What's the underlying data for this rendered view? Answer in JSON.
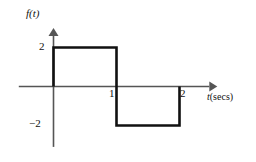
{
  "figure": {
    "background_color": "#ffffff",
    "axis_color": "#555555",
    "waveform_color": "#111111",
    "y_axis_label": "f(t)",
    "x_axis_label_var": "t",
    "x_axis_label_unit": "(secs)",
    "y_tick_pos2": "2",
    "y_tick_neg2": "−2",
    "x_tick_1": "1",
    "x_tick_2": "2"
  },
  "chart_data": {
    "type": "line",
    "title": "",
    "subtitle": "",
    "xlabel": "t(secs)",
    "ylabel": "f(t)",
    "xlim": [
      -0.55,
      2.6
    ],
    "ylim": [
      -3.1,
      3.0
    ],
    "grid": false,
    "legend": "none",
    "x_ticks": [
      1,
      2
    ],
    "x_tick_labels": [
      "1",
      "2"
    ],
    "y_ticks": [
      2,
      -2
    ],
    "y_tick_labels": [
      "2",
      "−2"
    ],
    "series": [
      {
        "name": "f(t)",
        "x": [
          0,
          0,
          1,
          1,
          2,
          2
        ],
        "values": [
          0,
          2,
          2,
          -2,
          -2,
          0
        ],
        "color": "#111111",
        "line_width": 2.6,
        "style": "step"
      }
    ],
    "segments": [
      {
        "name": "rise-at-0",
        "x1": 0,
        "y1": 0,
        "x2": 0,
        "y2": 2
      },
      {
        "name": "high-level",
        "x1": 0,
        "y1": 2,
        "x2": 1,
        "y2": 2
      },
      {
        "name": "fall-at-1",
        "x1": 1,
        "y1": 2,
        "x2": 1,
        "y2": -2
      },
      {
        "name": "low-level",
        "x1": 1,
        "y1": -2,
        "x2": 2,
        "y2": -2
      },
      {
        "name": "rise-at-2",
        "x1": 2,
        "y1": -2,
        "x2": 2,
        "y2": 0
      }
    ]
  }
}
